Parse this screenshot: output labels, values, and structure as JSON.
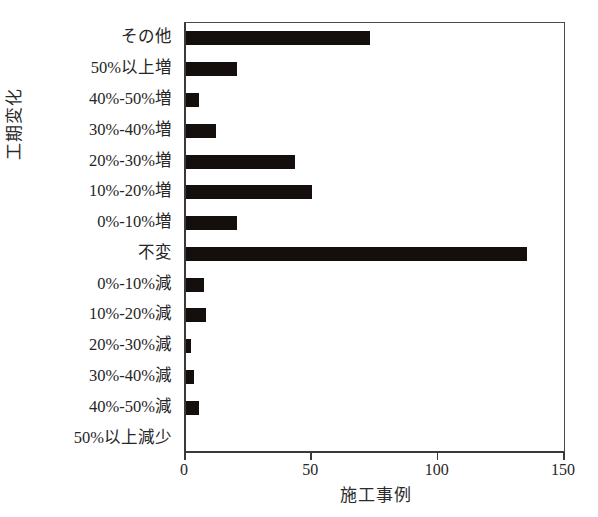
{
  "chart_data": {
    "type": "bar",
    "orientation": "horizontal",
    "title": "",
    "xlabel": "施工事例",
    "ylabel": "工期変化",
    "xlim": [
      0,
      150
    ],
    "xticks": [
      0,
      50,
      100,
      150
    ],
    "xtick_labels": [
      "0",
      "50",
      "100",
      "150"
    ],
    "grid": false,
    "legend": null,
    "bar_color": "#140f0d",
    "background_color": "#ffffff",
    "categories": [
      "その他",
      "50%以上増",
      "40%-50%増",
      "30%-40%増",
      "20%-30%増",
      "10%-20%増",
      "0%-10%増",
      "不変",
      "0%-10%減",
      "10%-20%減",
      "20%-30%減",
      "30%-40%減",
      "40%-50%減",
      "50%以上減少"
    ],
    "values": [
      73,
      20,
      5,
      12,
      43,
      50,
      20,
      135,
      7,
      8,
      2,
      3,
      5,
      0
    ]
  }
}
